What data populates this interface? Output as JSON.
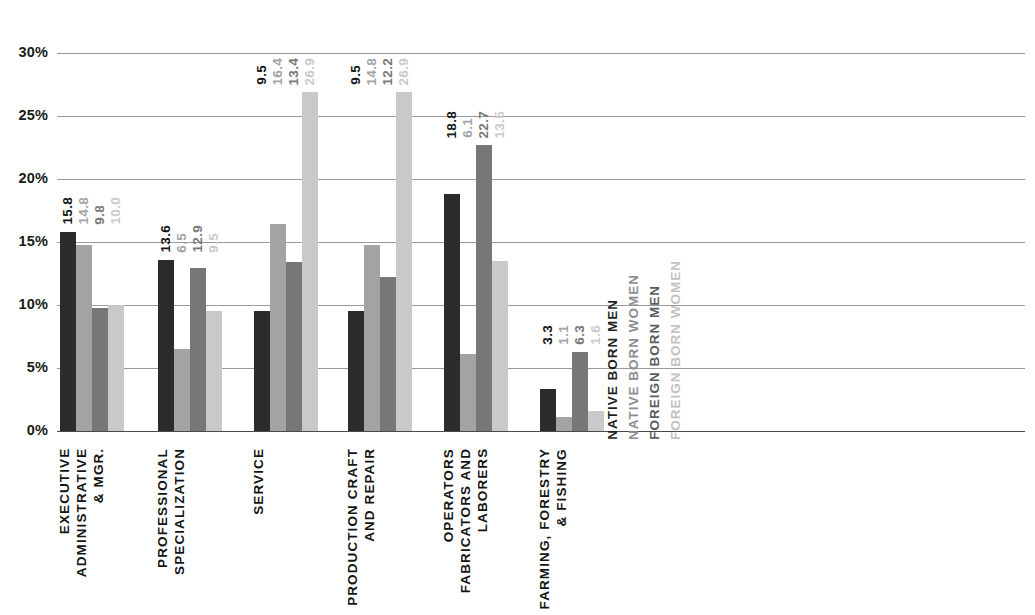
{
  "chart_data": {
    "type": "bar",
    "title": "",
    "subtitle": "",
    "xlabel": "",
    "ylabel": "",
    "ylim": [
      0,
      30
    ],
    "ytick_labels": [
      "30%",
      "25%",
      "20%",
      "15%",
      "10%",
      "5%",
      "0%"
    ],
    "ytick_values": [
      30,
      25,
      20,
      15,
      10,
      5,
      0
    ],
    "grid": true,
    "legend_position": "inside-right",
    "value_label_suffix": "",
    "categories": [
      "EXECUTIVE\nADMINISTRATIVE\n& MGR.",
      "PROFESSIONAL\nSPECIALIZATION",
      "SERVICE",
      "PRODUCTION CRAFT\nAND REPAIR",
      "OPERATORS\nFABRICATORS AND\nLABORERS",
      "FARMING, FORESTRY\n& FISHING"
    ],
    "series": [
      {
        "name": "NATIVE BORN MEN",
        "color": "#2b2b2b",
        "values": [
          15.8,
          13.6,
          9.5,
          9.5,
          18.8,
          3.3
        ],
        "labels": [
          "15.8",
          "13.6",
          "9.5",
          "9.5",
          "18.8",
          "3.3"
        ]
      },
      {
        "name": "NATIVE BORN WOMEN",
        "color": "#a3a3a3",
        "values": [
          14.8,
          6.5,
          16.4,
          14.8,
          6.1,
          1.1
        ],
        "labels": [
          "14.8",
          "6.5",
          "16.4",
          "14.8",
          "6.1",
          "1.1"
        ]
      },
      {
        "name": "FOREIGN BORN MEN",
        "color": "#777777",
        "values": [
          9.8,
          12.9,
          13.4,
          12.2,
          22.7,
          6.3
        ],
        "labels": [
          "9.8",
          "12.9",
          "13.4",
          "12.2",
          "22.7",
          "6.3"
        ]
      },
      {
        "name": "FOREIGN BORN WOMEN",
        "color": "#c9c9c9",
        "values": [
          10.0,
          9.5,
          26.9,
          26.9,
          13.5,
          1.6
        ],
        "labels": [
          "10.0",
          "9.5",
          "26.9",
          "26.9",
          "13.5",
          "1.6"
        ]
      }
    ]
  },
  "legend": {
    "items": [
      {
        "label": "NATIVE BORN MEN",
        "color": "#1f1f1f"
      },
      {
        "label": "NATIVE BORN WOMEN",
        "color": "#8d8d8d"
      },
      {
        "label": "FOREIGN BORN MEN",
        "color": "#5c5c5c"
      },
      {
        "label": "FOREIGN BORN WOMEN",
        "color": "#c2c2c2"
      }
    ]
  },
  "axis": {
    "ticks": [
      {
        "label": "30%",
        "value": 30
      },
      {
        "label": "25%",
        "value": 25
      },
      {
        "label": "20%",
        "value": 20
      },
      {
        "label": "15%",
        "value": 15
      },
      {
        "label": "10%",
        "value": 10
      },
      {
        "label": "5%",
        "value": 5
      },
      {
        "label": "0%",
        "value": 0
      }
    ]
  }
}
